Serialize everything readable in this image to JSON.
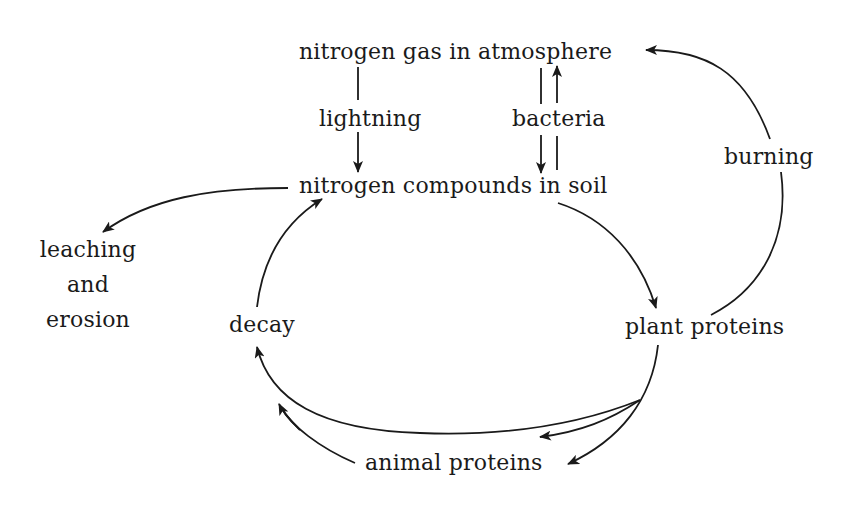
{
  "diagram": {
    "nodes": {
      "atmosphere": "nitrogen gas in atmosphere",
      "soil": "nitrogen compounds in soil",
      "plant": "plant proteins",
      "animal": "animal proteins",
      "decay": "decay",
      "leaching_line1": "leaching",
      "leaching_line2": "and",
      "leaching_line3": "erosion"
    },
    "edge_labels": {
      "lightning": "lightning",
      "bacteria": "bacteria",
      "burning": "burning"
    },
    "edges": [
      {
        "from": "nitrogen gas in atmosphere",
        "to": "nitrogen compounds in soil",
        "label": "lightning"
      },
      {
        "from": "nitrogen gas in atmosphere",
        "to": "nitrogen compounds in soil",
        "label": "bacteria"
      },
      {
        "from": "nitrogen compounds in soil",
        "to": "nitrogen gas in atmosphere",
        "label": "bacteria"
      },
      {
        "from": "nitrogen compounds in soil",
        "to": "leaching and erosion",
        "label": ""
      },
      {
        "from": "nitrogen compounds in soil",
        "to": "plant proteins",
        "label": ""
      },
      {
        "from": "plant proteins",
        "to": "nitrogen gas in atmosphere",
        "label": "burning"
      },
      {
        "from": "plant proteins",
        "to": "animal proteins",
        "label": ""
      },
      {
        "from": "plant proteins",
        "to": "decay",
        "label": ""
      },
      {
        "from": "animal proteins",
        "to": "decay",
        "label": ""
      },
      {
        "from": "decay",
        "to": "nitrogen compounds in soil",
        "label": ""
      }
    ]
  }
}
